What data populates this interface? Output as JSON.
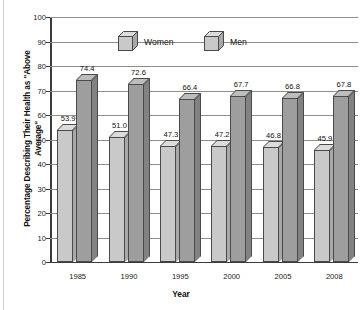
{
  "chart_data": {
    "type": "bar",
    "title": "",
    "xlabel": "Year",
    "ylabel": "Percentage Describing Their Health as \"Above Average\"",
    "categories": [
      "1985",
      "1990",
      "1995",
      "2000",
      "2005",
      "2008"
    ],
    "series": [
      {
        "name": "Women",
        "values": [
          53.9,
          51.0,
          47.3,
          47.2,
          46.8,
          45.9
        ],
        "color": "#c9c9c9"
      },
      {
        "name": "Men",
        "values": [
          74.4,
          72.6,
          66.4,
          67.7,
          66.8,
          67.8
        ],
        "color": "#9e9e9e"
      }
    ],
    "ylim": [
      0,
      100
    ],
    "ytick_step": 10,
    "yticks": [
      "100",
      "90",
      "80",
      "70",
      "60",
      "50",
      "40",
      "30",
      "20",
      "10",
      "0"
    ],
    "grid": true,
    "legend_position": "top-center",
    "style": "3d-bar"
  },
  "axes": {
    "y_title": "Percentage Describing Their Health as \"Above Average\"",
    "x_title": "Year"
  },
  "legend": {
    "items": [
      {
        "label": "Women"
      },
      {
        "label": "Men"
      }
    ]
  },
  "value_labels": {
    "women": [
      "53.9",
      "51.0",
      "47.3",
      "47.2",
      "46.8",
      "45.9"
    ],
    "men": [
      "74.4",
      "72.6",
      "66.4",
      "67.7",
      "66.8",
      "67.8"
    ]
  }
}
